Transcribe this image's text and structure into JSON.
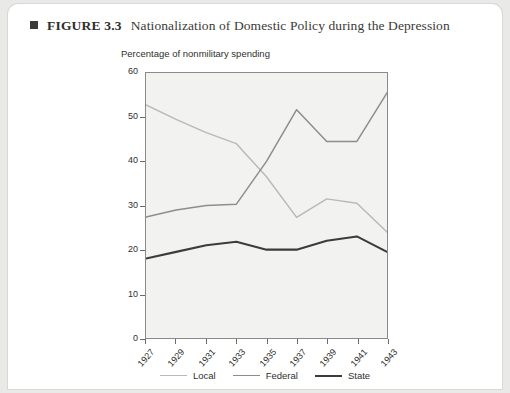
{
  "figure": {
    "marker": "square-bullet",
    "number": "FIGURE 3.3",
    "title": "Nationalization of Domestic Policy during the Depression"
  },
  "colors": {
    "local": "#b9b9b7",
    "federal": "#8d8d8b",
    "state": "#3c3c3a",
    "axis": "#8a8a88",
    "plot_background": "#f2f2f0",
    "page_background": "#ffffff",
    "text": "#2f2f2d"
  },
  "chart_data": {
    "type": "line",
    "title": "Nationalization of Domestic Policy during the Depression",
    "xlabel": "",
    "ylabel": "Percentage of nonmilitary spending",
    "categories": [
      "1927",
      "1929",
      "1931",
      "1933",
      "1935",
      "1937",
      "1939",
      "1941",
      "1943"
    ],
    "x": [
      1927,
      1929,
      1931,
      1933,
      1935,
      1937,
      1939,
      1941,
      1943
    ],
    "ylim": [
      0,
      60
    ],
    "yticks": [
      0,
      10,
      20,
      30,
      40,
      50,
      60
    ],
    "xlim": [
      1927,
      1943
    ],
    "grid": false,
    "legend_position": "bottom",
    "series": [
      {
        "name": "Local",
        "color": "#b9b9b7",
        "values": [
          52.8,
          49.5,
          46.5,
          44.0,
          36.5,
          27.3,
          31.5,
          30.5,
          24.0
        ]
      },
      {
        "name": "Federal",
        "color": "#8d8d8b",
        "values": [
          27.4,
          29.0,
          30.0,
          30.3,
          40.0,
          51.7,
          44.5,
          44.5,
          55.5
        ]
      },
      {
        "name": "State",
        "color": "#3c3c3a",
        "values": [
          18.0,
          19.5,
          21.0,
          21.8,
          20.0,
          20.0,
          22.0,
          23.0,
          19.5
        ]
      }
    ]
  },
  "legend": {
    "items": [
      {
        "label": "Local",
        "color": "#b9b9b7",
        "weight": 1.6
      },
      {
        "label": "Federal",
        "color": "#8d8d8b",
        "weight": 1.6
      },
      {
        "label": "State",
        "color": "#3c3c3a",
        "weight": 2.2
      }
    ]
  },
  "footnote": ""
}
